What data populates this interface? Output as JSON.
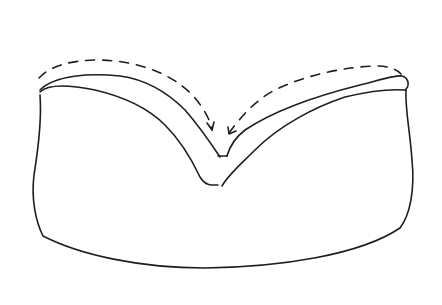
{
  "figure": {
    "kind": "hand-drawn sketch",
    "description": "Folded loaf/pillow shape with V-shaped crease in the top and dashed folding arrows pointing into the crease",
    "stroke_color": "#1e1e1e",
    "background": "#ffffff",
    "elements": [
      {
        "name": "body-outline",
        "style": "solid"
      },
      {
        "name": "left-top-flap",
        "style": "solid"
      },
      {
        "name": "right-top-flap",
        "style": "solid"
      },
      {
        "name": "left-fold-arrow",
        "style": "dashed",
        "direction": "toward center crease"
      },
      {
        "name": "right-fold-arrow",
        "style": "dashed",
        "direction": "toward center crease"
      }
    ]
  }
}
